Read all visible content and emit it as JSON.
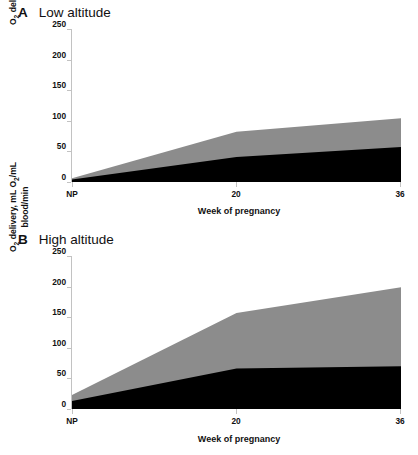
{
  "figure": {
    "panels": [
      {
        "letter": "A",
        "title": "Low altitude",
        "xtitle": "Week of pregnancy",
        "ytitle_line1": "O2 delivery, mL O2/mL",
        "ytitle_line2": "blood/min"
      },
      {
        "letter": "B",
        "title": "High altitude",
        "xtitle": "Week of pregnancy",
        "ytitle_line1": "O2 delivery, mL O2/mL",
        "ytitle_line2": "blood/min"
      }
    ]
  },
  "axis": {
    "yticks": [
      "0",
      "50",
      "100",
      "150",
      "200",
      "250"
    ],
    "xticks": [
      "NP",
      "20",
      "36"
    ]
  },
  "colors": {
    "series_lower": "#000000",
    "series_upper": "#8c8c8c",
    "axis": "#c2c2c2",
    "text": "#111111",
    "background": "#ffffff"
  },
  "chart_data": [
    {
      "type": "area",
      "title": "A  Low altitude",
      "xlabel": "Week of pregnancy",
      "ylabel": "O2 delivery, mL O2/mL blood/min",
      "categories": [
        "NP",
        "20",
        "36"
      ],
      "x": [
        0,
        20,
        36
      ],
      "ylim": [
        0,
        250
      ],
      "yticks": [
        0,
        50,
        100,
        150,
        200,
        250
      ],
      "grid": false,
      "legend": "none",
      "stacked": true,
      "series": [
        {
          "name": "lower-black",
          "color": "#000000",
          "values": [
            4,
            41,
            57
          ]
        },
        {
          "name": "upper-gray",
          "color": "#8c8c8c",
          "values": [
            2,
            41,
            47
          ]
        }
      ],
      "cumulative_top": [
        6,
        82,
        104
      ]
    },
    {
      "type": "area",
      "title": "B  High altitude",
      "xlabel": "Week of pregnancy",
      "ylabel": "O2 delivery, mL O2/mL blood/min",
      "categories": [
        "NP",
        "20",
        "36"
      ],
      "x": [
        0,
        20,
        36
      ],
      "ylim": [
        0,
        250
      ],
      "yticks": [
        0,
        50,
        100,
        150,
        200,
        250
      ],
      "grid": false,
      "legend": "none",
      "stacked": true,
      "series": [
        {
          "name": "lower-black",
          "color": "#000000",
          "values": [
            13,
            66,
            70
          ]
        },
        {
          "name": "upper-gray",
          "color": "#8c8c8c",
          "values": [
            10,
            91,
            129
          ]
        }
      ],
      "cumulative_top": [
        23,
        157,
        199
      ]
    }
  ]
}
